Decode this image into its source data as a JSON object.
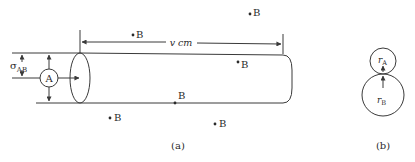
{
  "figure_a": {
    "caption": "(a)",
    "particle_label": "A",
    "sigma_symbol": "σ",
    "sigma_subscript": "AB",
    "length_label": "v cm",
    "points": [
      {
        "label": "B",
        "x": 133,
        "y": 33
      },
      {
        "label": "B",
        "x": 250,
        "y": 12
      },
      {
        "label": "B",
        "x": 238,
        "y": 62
      },
      {
        "label": "B",
        "x": 175,
        "y": 103
      },
      {
        "label": "B",
        "x": 110,
        "y": 118
      },
      {
        "label": "B",
        "x": 215,
        "y": 124
      }
    ]
  },
  "figure_b": {
    "caption": "(b)",
    "radius_a_symbol": "r",
    "radius_a_subscript": "A",
    "radius_b_symbol": "r",
    "radius_b_subscript": "B"
  },
  "colors": {
    "line": "#3a3a3a",
    "text": "#2a2a2a",
    "background": "#ffffff"
  }
}
